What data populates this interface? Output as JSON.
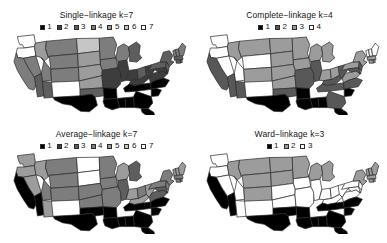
{
  "figure": {
    "type": "choropleth-map-grid",
    "rows": 2,
    "columns": 2,
    "background": "#ffffff"
  },
  "palette": {
    "note": "grayscale ramp, cluster 1 = black, highest cluster = white",
    "k7": [
      "#000000",
      "#3d3d3d",
      "#5e5e5e",
      "#7d7d7d",
      "#9c9c9c",
      "#c6c6c6",
      "#ffffff"
    ],
    "k4": [
      "#000000",
      "#585858",
      "#9c9c9c",
      "#ffffff"
    ],
    "k3": [
      "#000000",
      "#9c9c9c",
      "#ffffff"
    ],
    "border": "#2a2a2a"
  },
  "panels": [
    {
      "id": "single-linkage",
      "title": "Single−linkage k=7",
      "k": 7,
      "legend": [
        {
          "label": "1",
          "color": "#000000"
        },
        {
          "label": "2",
          "color": "#3d3d3d"
        },
        {
          "label": "3",
          "color": "#5e5e5e"
        },
        {
          "label": "4",
          "color": "#7d7d7d"
        },
        {
          "label": "5",
          "color": "#9c9c9c"
        },
        {
          "label": "6",
          "color": "#c6c6c6"
        },
        {
          "label": "7",
          "color": "#ffffff"
        }
      ],
      "clusters": {
        "WA": 7,
        "OR": 7,
        "CA": 4,
        "NV": 4,
        "ID": 5,
        "MT": 4,
        "WY": 4,
        "UT": 4,
        "AZ": 3,
        "CO": 4,
        "NM": 3,
        "ND": 6,
        "SD": 5,
        "NE": 5,
        "KS": 5,
        "OK": 3,
        "TX": 1,
        "MN": 4,
        "IA": 4,
        "MO": 2,
        "AR": 1,
        "LA": 1,
        "WI": 4,
        "IL": 2,
        "MS": 1,
        "AL": 1,
        "MI": 3,
        "IN": 2,
        "KY": 2,
        "TN": 1,
        "OH": 3,
        "WV": 2,
        "VA": 2,
        "NC": 1,
        "SC": 1,
        "GA": 1,
        "FL": 1,
        "PA": 3,
        "NY": 3,
        "VT": 4,
        "NH": 4,
        "ME": 4,
        "MA": 3,
        "RI": 3,
        "CT": 3,
        "NJ": 3,
        "DE": 2,
        "MD": 2
      }
    },
    {
      "id": "complete-linkage",
      "title": "Complete−linkage k=4",
      "k": 4,
      "legend": [
        {
          "label": "1",
          "color": "#000000"
        },
        {
          "label": "2",
          "color": "#585858"
        },
        {
          "label": "3",
          "color": "#9c9c9c"
        },
        {
          "label": "4",
          "color": "#ffffff"
        }
      ],
      "clusters": {
        "WA": 4,
        "OR": 4,
        "CA": 2,
        "NV": 4,
        "ID": 3,
        "MT": 3,
        "WY": 4,
        "UT": 4,
        "AZ": 2,
        "CO": 3,
        "NM": 2,
        "ND": 3,
        "SD": 3,
        "NE": 3,
        "KS": 3,
        "OK": 2,
        "TX": 1,
        "MN": 3,
        "IA": 3,
        "MO": 2,
        "AR": 1,
        "LA": 1,
        "WI": 3,
        "IL": 2,
        "MS": 1,
        "AL": 1,
        "MI": 3,
        "IN": 3,
        "KY": 2,
        "TN": 2,
        "OH": 3,
        "WV": 2,
        "VA": 3,
        "NC": 2,
        "SC": 1,
        "GA": 2,
        "FL": 1,
        "PA": 3,
        "NY": 3,
        "VT": 4,
        "NH": 4,
        "ME": 4,
        "MA": 3,
        "RI": 3,
        "CT": 3,
        "NJ": 2,
        "DE": 3,
        "MD": 2
      }
    },
    {
      "id": "average-linkage",
      "title": "Average−linkage k=7",
      "k": 7,
      "legend": [
        {
          "label": "1",
          "color": "#000000"
        },
        {
          "label": "2",
          "color": "#3d3d3d"
        },
        {
          "label": "3",
          "color": "#5e5e5e"
        },
        {
          "label": "4",
          "color": "#7d7d7d"
        },
        {
          "label": "5",
          "color": "#9c9c9c"
        },
        {
          "label": "6",
          "color": "#c6c6c6"
        },
        {
          "label": "7",
          "color": "#ffffff"
        }
      ],
      "clusters": {
        "WA": 5,
        "OR": 5,
        "CA": 1,
        "NV": 5,
        "ID": 5,
        "MT": 4,
        "WY": 4,
        "UT": 4,
        "AZ": 1,
        "CO": 4,
        "NM": 5,
        "ND": 7,
        "SD": 7,
        "NE": 4,
        "KS": 4,
        "OK": 1,
        "TX": 1,
        "MN": 4,
        "IA": 4,
        "MO": 4,
        "AR": 1,
        "LA": 1,
        "WI": 5,
        "IL": 3,
        "MS": 1,
        "AL": 1,
        "MI": 3,
        "IN": 5,
        "KY": 5,
        "TN": 1,
        "OH": 4,
        "WV": 5,
        "VA": 3,
        "NC": 1,
        "SC": 1,
        "GA": 1,
        "FL": 1,
        "PA": 4,
        "NY": 4,
        "VT": 5,
        "NH": 5,
        "ME": 5,
        "MA": 4,
        "RI": 4,
        "CT": 4,
        "NJ": 4,
        "DE": 5,
        "MD": 3
      }
    },
    {
      "id": "ward-linkage",
      "title": "Ward−linkage k=3",
      "k": 3,
      "legend": [
        {
          "label": "1",
          "color": "#000000"
        },
        {
          "label": "2",
          "color": "#9c9c9c"
        },
        {
          "label": "3",
          "color": "#ffffff"
        }
      ],
      "clusters": {
        "WA": 3,
        "OR": 3,
        "CA": 1,
        "NV": 3,
        "ID": 2,
        "MT": 2,
        "WY": 2,
        "UT": 3,
        "AZ": 1,
        "CO": 2,
        "NM": 3,
        "ND": 2,
        "SD": 2,
        "NE": 3,
        "KS": 3,
        "OK": 1,
        "TX": 1,
        "MN": 2,
        "IA": 3,
        "MO": 3,
        "AR": 1,
        "LA": 1,
        "WI": 2,
        "IL": 3,
        "MS": 1,
        "AL": 1,
        "MI": 2,
        "IN": 3,
        "KY": 3,
        "TN": 1,
        "OH": 3,
        "WV": 3,
        "VA": 3,
        "NC": 1,
        "SC": 1,
        "GA": 1,
        "FL": 1,
        "PA": 3,
        "NY": 2,
        "VT": 2,
        "NH": 2,
        "ME": 2,
        "MA": 2,
        "RI": 2,
        "CT": 2,
        "NJ": 3,
        "DE": 3,
        "MD": 3
      }
    }
  ]
}
